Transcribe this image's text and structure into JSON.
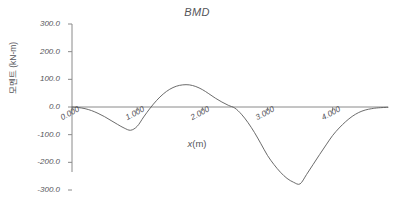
{
  "chart_data": {
    "type": "line",
    "title": "BMD",
    "xlabel": "x (m)",
    "xlabel_var": "x",
    "xlabel_unit": "(m)",
    "ylabel": "모멘트 (kN-m)",
    "xlim": [
      0.0,
      4.85
    ],
    "ylim": [
      -300.0,
      300.0
    ],
    "grid": false,
    "legend": null,
    "xticks": [
      0.0,
      1.0,
      2.0,
      3.0,
      4.0
    ],
    "xtick_labels": [
      "0.000",
      "1.000",
      "2.000",
      "3.000",
      "4.000"
    ],
    "yticks": [
      300.0,
      200.0,
      100.0,
      0.0,
      -100.0,
      -200.0,
      -300.0
    ],
    "ytick_labels": [
      "300.0",
      "200.0",
      "100.0",
      "0.0",
      "-100.0",
      "-200.0",
      "-300.0"
    ],
    "line_color": "#5a5a5a",
    "axis_color": "#8a8a8a",
    "series": [
      {
        "name": "Bending Moment",
        "x": [
          0.0,
          0.1,
          0.2,
          0.3,
          0.4,
          0.5,
          0.6,
          0.7,
          0.8,
          0.9,
          1.0,
          1.1,
          1.2,
          1.3,
          1.4,
          1.5,
          1.6,
          1.7,
          1.8,
          1.9,
          2.0,
          2.1,
          2.2,
          2.3,
          2.4,
          2.5,
          2.6,
          2.7,
          2.8,
          2.9,
          3.0,
          3.1,
          3.2,
          3.3,
          3.4,
          3.5,
          3.6,
          3.7,
          3.8,
          3.9,
          4.0,
          4.1,
          4.2,
          4.3,
          4.4,
          4.5,
          4.6,
          4.7,
          4.85
        ],
        "y": [
          0.0,
          -2.0,
          -6.0,
          -13.0,
          -23.0,
          -35.0,
          -49.0,
          -63.0,
          -76.0,
          -84.0,
          -70.0,
          -36.0,
          -4.0,
          24.0,
          47.0,
          64.0,
          75.0,
          80.0,
          80.0,
          74.0,
          63.0,
          48.0,
          32.0,
          18.0,
          6.0,
          -4.0,
          -26.0,
          -56.0,
          -92.0,
          -133.0,
          -175.0,
          -208.0,
          -236.0,
          -258.0,
          -272.0,
          -278.0,
          -244.0,
          -208.0,
          -172.0,
          -137.0,
          -103.0,
          -76.0,
          -53.0,
          -34.0,
          -20.0,
          -11.0,
          -6.0,
          -3.0,
          -1.0
        ]
      }
    ],
    "annotations": {
      "local_min_1": {
        "x": 0.9,
        "y": -84.0
      },
      "local_max": {
        "x": 1.75,
        "y": 80.0
      },
      "global_min": {
        "x": 3.5,
        "y": -278.0
      }
    }
  }
}
